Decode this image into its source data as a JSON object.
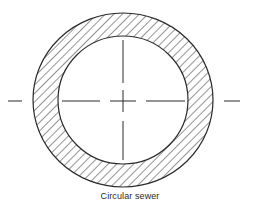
{
  "figure": {
    "caption": "Circular sewer",
    "type": "cross-section",
    "shape": "circular pipe wall with hatched section and dash-dot centerlines"
  },
  "colors": {
    "line": "#2a2a2a",
    "background": "#ffffff"
  }
}
